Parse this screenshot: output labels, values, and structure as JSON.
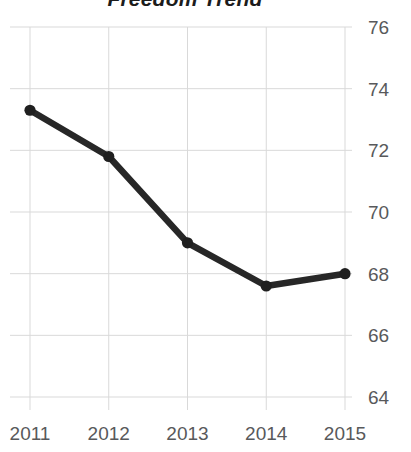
{
  "chart_data": {
    "type": "line",
    "title": "Freedom Trend",
    "xlabel": "",
    "ylabel": "",
    "categories": [
      "2011",
      "2012",
      "2013",
      "2014",
      "2015"
    ],
    "values": [
      73.3,
      71.8,
      69.0,
      67.6,
      68.0
    ],
    "series": [
      {
        "name": "Freedom Trend",
        "values": [
          73.3,
          71.8,
          69.0,
          67.6,
          68.0
        ]
      }
    ],
    "ylim": [
      64,
      76
    ],
    "yticks": [
      76,
      74,
      72,
      70,
      68,
      66,
      64
    ],
    "ytick_labels": [
      "76",
      "74",
      "72",
      "70",
      "68",
      "66",
      "64"
    ],
    "xtick_labels": [
      "2011",
      "2012",
      "2013",
      "2014",
      "2015"
    ],
    "y_axis_position": "right",
    "grid": true,
    "grid_axes": "both",
    "legend": "none",
    "markers": true,
    "colors": {
      "line": "#272727",
      "marker": "#1f1f1f",
      "grid": "#d9d9d9",
      "tick_text": "#58595b",
      "title_text": "#1c1c1c",
      "background": "#ffffff"
    }
  }
}
